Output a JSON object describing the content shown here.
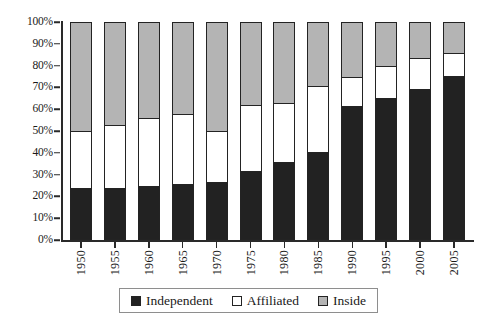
{
  "chart_data": {
    "type": "bar",
    "subtype": "stacked-percentage",
    "title": "",
    "xlabel": "",
    "ylabel": "",
    "ylim": [
      0,
      100
    ],
    "yticks": [
      "0%",
      "10%",
      "20%",
      "30%",
      "40%",
      "50%",
      "60%",
      "70%",
      "80%",
      "90%",
      "100%"
    ],
    "ytick_values": [
      0,
      10,
      20,
      30,
      40,
      50,
      60,
      70,
      80,
      90,
      100
    ],
    "grid": false,
    "legend_position": "bottom",
    "categories": [
      "1950",
      "1955",
      "1960",
      "1965",
      "1970",
      "1975",
      "1980",
      "1985",
      "1990",
      "1995",
      "2000",
      "2005"
    ],
    "series": [
      {
        "name": "Independent",
        "color": "#222222",
        "values": [
          23,
          23,
          24,
          25,
          26,
          31,
          35,
          40,
          61,
          65,
          69,
          75
        ]
      },
      {
        "name": "Affiliated",
        "color": "#ffffff",
        "values": [
          27,
          30,
          32,
          33,
          24,
          31,
          28,
          31,
          14,
          15,
          15,
          11
        ]
      },
      {
        "name": "Inside",
        "color": "#b4b4b4",
        "values": [
          50,
          47,
          44,
          42,
          50,
          38,
          37,
          29,
          25,
          20,
          16,
          14
        ]
      }
    ],
    "cumulative_tops": {
      "independent": [
        23,
        23,
        24,
        25,
        26,
        31,
        35,
        40,
        61,
        65,
        69,
        75
      ],
      "affiliated": [
        50,
        53,
        56,
        58,
        50,
        62,
        63,
        71,
        75,
        80,
        84,
        86
      ]
    }
  },
  "legend": {
    "items": [
      {
        "label": "Independent",
        "key": "independent"
      },
      {
        "label": "Affiliated",
        "key": "affiliated"
      },
      {
        "label": "Inside",
        "key": "inside"
      }
    ]
  },
  "colors": {
    "independent": "#222222",
    "affiliated": "#ffffff",
    "inside": "#b4b4b4",
    "outline": "#232323",
    "axis": "#2a2a2a",
    "background": "#ffffff"
  }
}
